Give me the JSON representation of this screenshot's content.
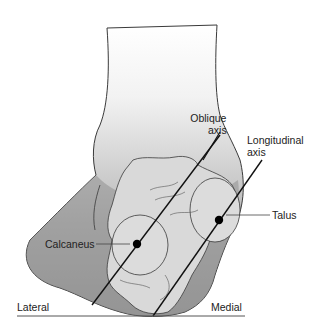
{
  "figure": {
    "labels": {
      "oblique_axis_line1": "Oblique",
      "oblique_axis_line2": "axis",
      "longitudinal_axis_line1": "Longitudinal",
      "longitudinal_axis_line2": "axis",
      "talus": "Talus",
      "calcaneus": "Calcaneus",
      "lateral": "Lateral",
      "medial": "Medial"
    },
    "colors": {
      "leg_gradient_top": "#ffffff",
      "leg_gradient_bottom": "#9a9a9a",
      "soft_tissue": "#8f8f8f",
      "bone": "#d9d9d9",
      "outline": "#3a3a3a",
      "axis_line": "#111111"
    }
  }
}
